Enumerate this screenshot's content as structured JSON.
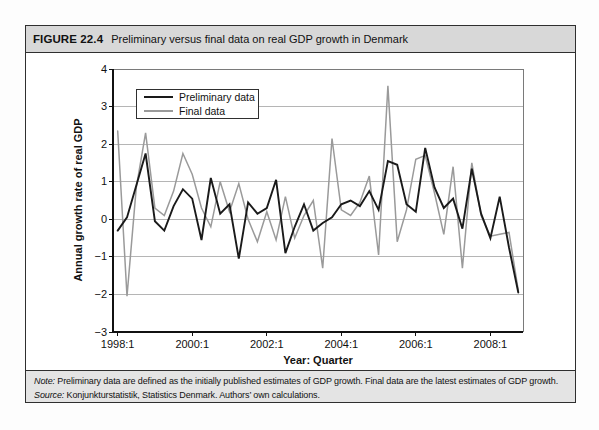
{
  "header": {
    "label": "FIGURE 22.4",
    "title": "Preliminary versus final data on real GDP growth in Denmark"
  },
  "chart_data": {
    "type": "line",
    "title": "",
    "xlabel": "Year: Quarter",
    "ylabel": "Annual growth rate of real GDP",
    "ylim": [
      -3,
      4
    ],
    "y_ticks": [
      4,
      3,
      2,
      1,
      0,
      -1,
      -2,
      -3
    ],
    "grid": "horizontal",
    "legend_position": "top-left",
    "x_tick_labels": [
      "1998:1",
      "2000:1",
      "2002:1",
      "2004:1",
      "2006:1",
      "2008:1"
    ],
    "x_tick_indices": [
      0,
      8,
      16,
      24,
      32,
      40
    ],
    "x": [
      "1998:1",
      "1998:2",
      "1998:3",
      "1998:4",
      "1999:1",
      "1999:2",
      "1999:3",
      "1999:4",
      "2000:1",
      "2000:2",
      "2000:3",
      "2000:4",
      "2001:1",
      "2001:2",
      "2001:3",
      "2001:4",
      "2002:1",
      "2002:2",
      "2002:3",
      "2002:4",
      "2003:1",
      "2003:2",
      "2003:3",
      "2003:4",
      "2004:1",
      "2004:2",
      "2004:3",
      "2004:4",
      "2005:1",
      "2005:2",
      "2005:3",
      "2005:4",
      "2006:1",
      "2006:2",
      "2006:3",
      "2006:4",
      "2007:1",
      "2007:2",
      "2007:3",
      "2007:4",
      "2008:1",
      "2008:2",
      "2008:3",
      "2008:4"
    ],
    "series": [
      {
        "name": "Preliminary data",
        "color": "#1a1a1a",
        "stroke_width": 1.9,
        "values": [
          -0.3,
          0.05,
          0.9,
          1.75,
          -0.05,
          -0.3,
          0.35,
          0.8,
          0.55,
          -0.55,
          1.1,
          0.15,
          0.4,
          -1.05,
          0.45,
          0.15,
          0.3,
          1.05,
          -0.9,
          -0.2,
          0.4,
          -0.3,
          -0.1,
          0.05,
          0.4,
          0.5,
          0.35,
          0.75,
          0.25,
          1.55,
          1.45,
          0.4,
          0.2,
          1.9,
          0.85,
          0.3,
          0.55,
          -0.25,
          1.35,
          0.15,
          -0.5,
          0.6,
          -0.75,
          -1.95
        ]
      },
      {
        "name": "Final data",
        "color": "#9a9a9a",
        "stroke_width": 1.5,
        "values": [
          2.35,
          -2.05,
          0.85,
          2.3,
          0.3,
          0.1,
          0.75,
          1.75,
          1.2,
          0.3,
          -0.2,
          1.0,
          0.2,
          0.95,
          0.0,
          -0.6,
          0.2,
          -0.55,
          0.6,
          -0.5,
          0.1,
          0.5,
          -1.3,
          2.15,
          0.25,
          0.1,
          0.45,
          1.15,
          -0.95,
          3.55,
          -0.6,
          0.25,
          1.6,
          1.7,
          0.7,
          -0.4,
          1.4,
          -1.3,
          1.5,
          0.1,
          -0.45,
          -0.4,
          -0.35,
          -1.9
        ]
      }
    ],
    "colors": {
      "gridline": "#b5b5b5",
      "axis": "#111111",
      "plot_border": "#7a7a7a",
      "header_bg": "#d8d8d8",
      "note_bg": "#e4e4e4"
    }
  },
  "notes": {
    "note_label": "Note:",
    "note_text": " Preliminary data are defined as the initially published estimates of GDP growth. Final data are the latest estimates of GDP growth.",
    "source_label": "Source:",
    "source_text": " Konjunkturstatistik, Statistics Denmark. Authors’ own calculations."
  }
}
